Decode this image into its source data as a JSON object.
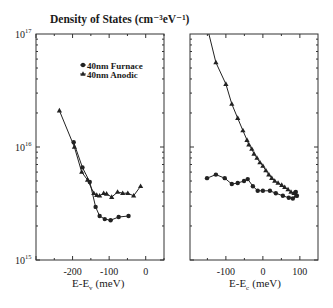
{
  "figure": {
    "title": "Density of States (cm⁻³eV⁻¹)",
    "caption": ""
  },
  "chart_data": [
    {
      "type": "line",
      "panel": "left",
      "title": "Density of States (cm^-3 eV^-1)",
      "xlabel": "E-E_v (meV)",
      "xlabel_main": "E-E",
      "xlabel_sub": "v",
      "xlabel_unit": "(meV)",
      "ylabel": "Density of States (cm^-3 eV^-1)",
      "yscale": "log",
      "xlim": [
        -300,
        50
      ],
      "ylim": [
        1000000000000000.0,
        1e+17
      ],
      "xticks": [
        -200,
        -100,
        0
      ],
      "xtick_labels": [
        "-200",
        "-100",
        "0"
      ],
      "yticks": [
        1000000000000000.0,
        1e+16,
        1e+17
      ],
      "ytick_labels": [
        {
          "base": "10",
          "exp": "15"
        },
        {
          "base": "10",
          "exp": "16"
        },
        {
          "base": "10",
          "exp": "17"
        }
      ],
      "grid": false,
      "legend": {
        "position": "upper-center",
        "entries": [
          {
            "label": "40nm Furnace",
            "marker": "circle"
          },
          {
            "label": "40nm Anodic",
            "marker": "triangle"
          }
        ]
      },
      "series": [
        {
          "name": "40nm Furnace",
          "marker": "circle",
          "x": [
            -197,
            -173,
            -153,
            -137,
            -126,
            -112,
            -96,
            -74,
            -47
          ],
          "y": [
            1.1e+16,
            6600000000000000.0,
            4900000000000000.0,
            2950000000000000.0,
            2450000000000000.0,
            2300000000000000.0,
            2250000000000000.0,
            2400000000000000.0,
            2450000000000000.0
          ]
        },
        {
          "name": "40nm Anodic",
          "marker": "triangle",
          "x": [
            -236,
            -195,
            -175,
            -159,
            -142,
            -134,
            -126,
            -115,
            -107,
            -93,
            -77,
            -63,
            -49,
            -33,
            -14
          ],
          "y": [
            2.1e+16,
            1e+16,
            6000000000000000.0,
            5100000000000000.0,
            3900000000000000.0,
            3750000000000000.0,
            3700000000000000.0,
            3900000000000000.0,
            3850000000000000.0,
            3600000000000000.0,
            4000000000000000.0,
            3900000000000000.0,
            3900000000000000.0,
            3700000000000000.0,
            4500000000000000.0
          ]
        }
      ]
    },
    {
      "type": "line",
      "panel": "right",
      "xlabel": "E-E_c (meV)",
      "xlabel_main": "E-E",
      "xlabel_sub": "c",
      "xlabel_unit": "(meV)",
      "yscale": "log",
      "xlim": [
        -197,
        149
      ],
      "ylim": [
        1000000000000000.0,
        1e+17
      ],
      "xticks": [
        -100,
        0,
        100
      ],
      "xtick_labels": [
        "-100",
        "0",
        "100"
      ],
      "grid": false,
      "series": [
        {
          "name": "40nm Furnace",
          "marker": "circle",
          "x": [
            -151,
            -127,
            -103,
            -84,
            -68,
            -51,
            -41,
            -27,
            -14,
            0,
            19,
            35,
            54,
            70,
            81,
            92,
            89
          ],
          "y": [
            5300000000000000.0,
            5700000000000000.0,
            5300000000000000.0,
            4700000000000000.0,
            4800000000000000.0,
            5000000000000000.0,
            5200000000000000.0,
            4500000000000000.0,
            4100000000000000.0,
            4100000000000000.0,
            4100000000000000.0,
            3900000000000000.0,
            3700000000000000.0,
            3550000000000000.0,
            3500000000000000.0,
            3700000000000000.0,
            4000000000000000.0
          ]
        },
        {
          "name": "40nm Anodic",
          "marker": "triangle",
          "line_start": {
            "x": -146,
            "y": 1e+17
          },
          "x": [
            -127,
            -100,
            -84,
            -68,
            -54,
            -43,
            -38,
            -30,
            -24,
            -16,
            -8,
            0,
            8,
            16,
            24,
            32,
            41,
            51,
            59,
            68,
            76,
            84,
            89
          ],
          "y": [
            5.6e+16,
            3.6e+16,
            2.4e+16,
            1.8e+16,
            1.4e+16,
            1.15e+16,
            1.05e+16,
            9600000000000000.0,
            8700000000000000.0,
            8000000000000000.0,
            7300000000000000.0,
            6800000000000000.0,
            6200000000000000.0,
            5700000000000000.0,
            5300000000000000.0,
            5000000000000000.0,
            4800000000000000.0,
            4600000000000000.0,
            4400000000000000.0,
            4200000000000000.0,
            4000000000000000.0,
            3900000000000000.0,
            3700000000000000.0
          ]
        }
      ]
    }
  ]
}
